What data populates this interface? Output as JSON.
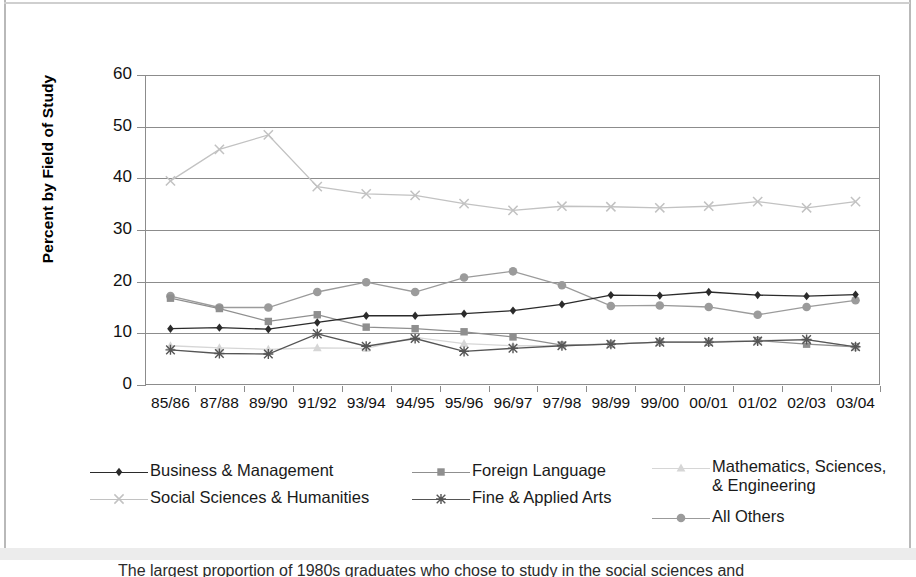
{
  "chart_data": {
    "type": "line",
    "title": "",
    "xlabel": "",
    "ylabel": "Percent by Field of Study",
    "ylim": [
      0,
      60
    ],
    "ytick_labels": [
      "60",
      "50",
      "40",
      "30",
      "20",
      "10",
      "0"
    ],
    "yticks": [
      60,
      50,
      40,
      30,
      20,
      10,
      0
    ],
    "grid": true,
    "legend_position": "bottom",
    "categories": [
      "85/86",
      "87/88",
      "89/90",
      "91/92",
      "93/94",
      "94/95",
      "95/96",
      "96/97",
      "97/98",
      "98/99",
      "99/00",
      "00/01",
      "01/02",
      "02/03",
      "03/04"
    ],
    "series": [
      {
        "name": "Business & Management",
        "marker": "diamond",
        "color": "#2b2b2b",
        "values": [
          10.9,
          11.1,
          10.8,
          12.1,
          13.4,
          13.4,
          13.8,
          14.4,
          15.6,
          17.4,
          17.3,
          18.0,
          17.4,
          17.2,
          17.5
        ]
      },
      {
        "name": "Foreign Language",
        "marker": "square",
        "color": "#8f8f8f",
        "values": [
          16.8,
          14.8,
          12.3,
          13.6,
          11.2,
          10.9,
          10.3,
          9.3,
          7.7,
          7.9,
          8.3,
          8.3,
          8.6,
          7.9,
          7.4
        ]
      },
      {
        "name": "Mathematics, Sciences,\n& Engineering",
        "marker": "triangle",
        "color": "#d6d6d6",
        "values": [
          7.6,
          7.2,
          6.9,
          7.2,
          7.1,
          9.2,
          8.0,
          7.6,
          7.6,
          7.9,
          8.3,
          8.4,
          8.6,
          8.8,
          7.4
        ]
      },
      {
        "name": "Social Sciences & Humanities",
        "marker": "x",
        "color": "#c2c2c2",
        "values": [
          39.5,
          45.6,
          48.4,
          38.4,
          37.0,
          36.7,
          35.1,
          33.8,
          34.6,
          34.5,
          34.3,
          34.6,
          35.5,
          34.3,
          35.5
        ]
      },
      {
        "name": "Fine & Applied Arts",
        "marker": "star",
        "color": "#555555",
        "values": [
          6.8,
          6.1,
          6.0,
          9.9,
          7.5,
          9.0,
          6.5,
          7.1,
          7.6,
          7.9,
          8.3,
          8.3,
          8.5,
          8.8,
          7.4
        ]
      },
      {
        "name": "All Others",
        "marker": "circle",
        "color": "#9b9b9b",
        "values": [
          17.2,
          15.0,
          15.0,
          18.0,
          19.9,
          18.0,
          20.8,
          22.0,
          19.3,
          15.3,
          15.4,
          15.1,
          13.6,
          15.1,
          16.4
        ]
      }
    ]
  },
  "legend": {
    "items": [
      {
        "label": "Business & Management"
      },
      {
        "label": "Foreign Language"
      },
      {
        "label": "Mathematics, Sciences,\n& Engineering"
      },
      {
        "label": "Social Sciences & Humanities"
      },
      {
        "label": "Fine & Applied Arts"
      },
      {
        "label": "All Others"
      }
    ]
  },
  "caption": {
    "text": "The largest proportion of 1980s graduates who chose to study in the social sciences and"
  }
}
